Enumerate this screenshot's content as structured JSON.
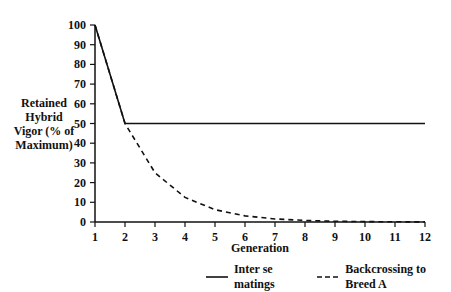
{
  "chart_data": {
    "type": "line",
    "title": "",
    "xlabel": "Generation",
    "ylabel": "Retained Hybrid Vigor (% of Maximum)",
    "ylabel_lines": [
      "Retained",
      "Hybrid",
      "Vigor (% of",
      "Maximum)"
    ],
    "x": [
      1,
      2,
      3,
      4,
      5,
      6,
      7,
      8,
      9,
      10,
      11,
      12
    ],
    "x_ticks": [
      "1",
      "2",
      "3",
      "4",
      "5",
      "6",
      "7",
      "8",
      "9",
      "10",
      "11",
      "12"
    ],
    "y_ticks": [
      "0",
      "10",
      "20",
      "30",
      "40",
      "50",
      "60",
      "70",
      "80",
      "90",
      "100"
    ],
    "ylim": [
      0,
      100
    ],
    "xlim": [
      1,
      12
    ],
    "grid": false,
    "legend_position": "bottom",
    "series": [
      {
        "name": "Inter se matings",
        "style": "solid",
        "values": [
          100,
          50,
          50,
          50,
          50,
          50,
          50,
          50,
          50,
          50,
          50,
          50
        ]
      },
      {
        "name": "Backcrossing to Breed A",
        "style": "dashed",
        "values": [
          100,
          50,
          25,
          12.5,
          6.25,
          3.13,
          1.56,
          0.78,
          0.39,
          0.2,
          0.1,
          0.05
        ]
      }
    ]
  },
  "legend": {
    "items": [
      {
        "label": "Inter se matings",
        "style": "solid"
      },
      {
        "label": "Backcrossing to Breed A",
        "style": "dashed"
      }
    ]
  },
  "colors": {
    "line": "#111111",
    "background": "#ffffff"
  }
}
